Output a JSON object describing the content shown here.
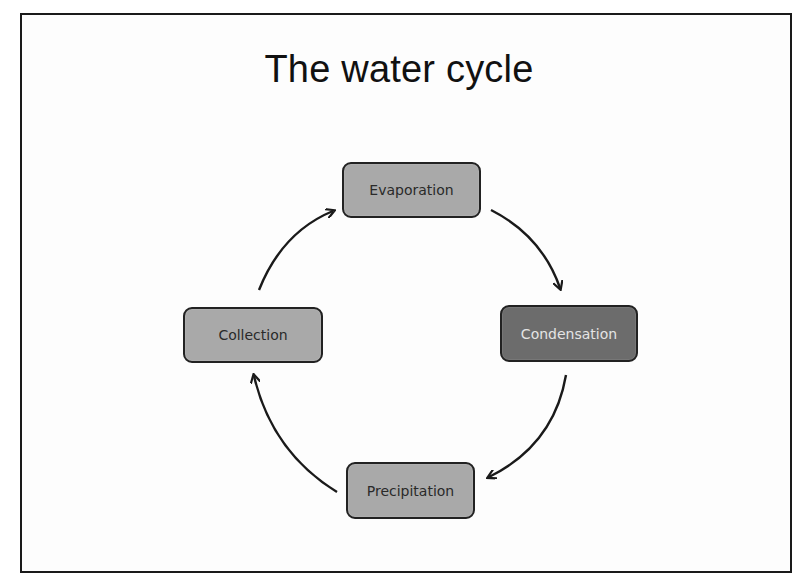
{
  "slide": {
    "title": "The water cycle"
  },
  "diagram": {
    "type": "cycle",
    "nodes": [
      {
        "id": "evaporation",
        "label": "Evaporation",
        "fill": "#a9a9a9",
        "text_color": "#2a2a2a"
      },
      {
        "id": "condensation",
        "label": "Condensation",
        "fill": "#6c6c6c",
        "text_color": "#e4e4e4"
      },
      {
        "id": "precipitation",
        "label": "Precipitation",
        "fill": "#a9a9a9",
        "text_color": "#2a2a2a"
      },
      {
        "id": "collection",
        "label": "Collection",
        "fill": "#a9a9a9",
        "text_color": "#2a2a2a"
      }
    ],
    "edges": [
      {
        "from": "evaporation",
        "to": "condensation"
      },
      {
        "from": "condensation",
        "to": "precipitation"
      },
      {
        "from": "precipitation",
        "to": "collection"
      },
      {
        "from": "collection",
        "to": "evaporation"
      }
    ],
    "arrow_color": "#1a1a1a"
  }
}
